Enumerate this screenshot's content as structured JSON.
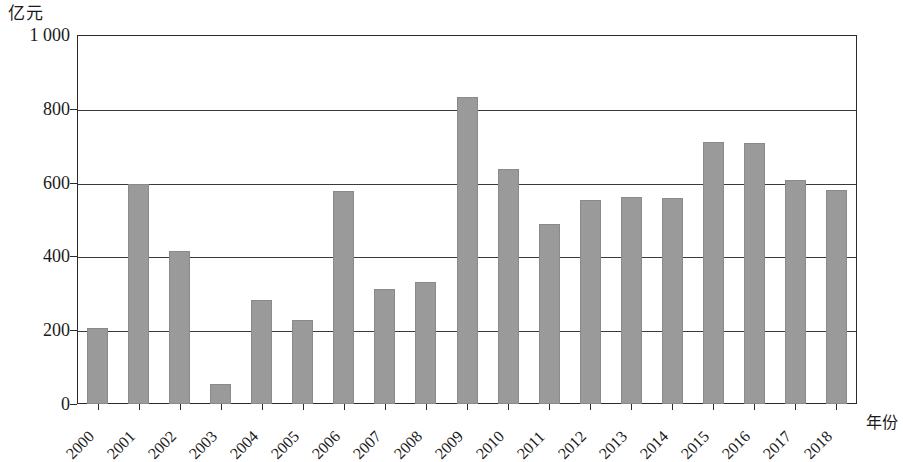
{
  "chart_data": {
    "type": "bar",
    "title": "",
    "subtitle": "",
    "ylabel": "亿元",
    "xlabel": "年份",
    "ylim": [
      0,
      1000
    ],
    "y_ticks": [
      0,
      200,
      400,
      600,
      800,
      1000
    ],
    "y_tick_labels": [
      "0",
      "200",
      "400",
      "600",
      "800",
      "1 000"
    ],
    "grid": "horizontal",
    "legend": "none",
    "bar_color": "#9a9a9a",
    "axis_color": "#2b2b2b",
    "categories": [
      "2000",
      "2001",
      "2002",
      "2003",
      "2004",
      "2005",
      "2006",
      "2007",
      "2008",
      "2009",
      "2010",
      "2011",
      "2012",
      "2013",
      "2014",
      "2015",
      "2016",
      "2017",
      "2018"
    ],
    "values": [
      205,
      597,
      415,
      55,
      283,
      228,
      578,
      312,
      330,
      832,
      638,
      487,
      553,
      560,
      558,
      710,
      707,
      607,
      580
    ]
  }
}
